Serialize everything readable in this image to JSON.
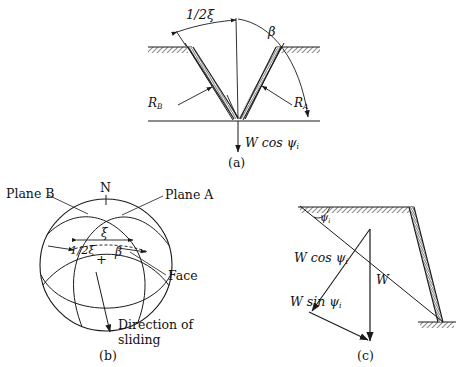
{
  "figure": {
    "type": "engineering-diagram"
  },
  "panel_a": {
    "caption": "(a)",
    "labels": {
      "half_xi": "1/2ξ",
      "beta": "β",
      "reaction_b": "R",
      "reaction_b_sub": "B",
      "reaction_a": "R",
      "reaction_a_sub": "A",
      "weight_normal": "W cos ψ",
      "weight_normal_sub": "i"
    }
  },
  "panel_b": {
    "caption": "(b)",
    "labels": {
      "north": "N",
      "plane_b": "Plane B",
      "plane_a": "Plane A",
      "face": "Face",
      "xi": "ξ",
      "half_xi": "1/2ξ",
      "beta": "β",
      "center_mark": "+",
      "direction_line1": "Direction of",
      "direction_line2": "sliding"
    }
  },
  "panel_c": {
    "caption": "(c)",
    "labels": {
      "psi": "ψ",
      "psi_sub": "i",
      "w_cos": "W cos ψ",
      "w_cos_sub": "i",
      "w_sin": "W sin ψ",
      "w_sin_sub": "i",
      "weight": "W"
    }
  },
  "style": {
    "line_color": "#1a1a1a",
    "hatch_color": "#8c8c8c",
    "background": "#ffffff"
  }
}
